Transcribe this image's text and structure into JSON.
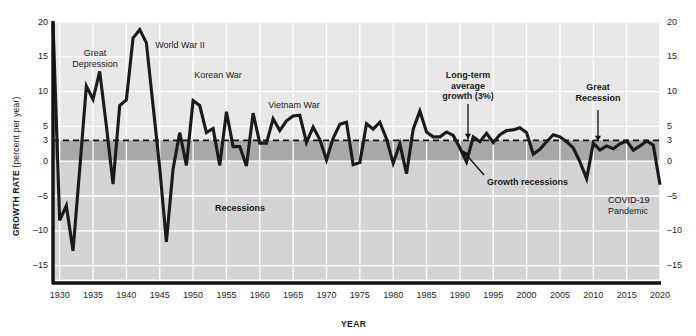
{
  "chart_data": {
    "type": "line",
    "title": "",
    "xlabel": "YEAR",
    "ylabel": "GROWTH RATE",
    "ylabel_unit": "(percent per year)",
    "xlim": [
      1929,
      2020
    ],
    "ylim": [
      -17,
      20
    ],
    "y_ticks": [
      20,
      15,
      10,
      5,
      3,
      0,
      -5,
      -10,
      -15
    ],
    "y_tick_labels": [
      "20",
      "15",
      "10",
      "5",
      "3",
      "0",
      "–5",
      "–10",
      "–15"
    ],
    "x_ticks": [
      1930,
      1935,
      1940,
      1945,
      1950,
      1955,
      1960,
      1965,
      1970,
      1975,
      1980,
      1985,
      1990,
      1995,
      2000,
      2005,
      2010,
      2015,
      2020
    ],
    "x_tick_labels": [
      "1930",
      "1935",
      "1940",
      "1945",
      "1950",
      "1955",
      "1960",
      "1965",
      "1970",
      "1975",
      "1980",
      "1985",
      "1990",
      "1995",
      "2000",
      "2005",
      "2010",
      "2015",
      "2020"
    ],
    "grid": true,
    "legend": "none",
    "reference_line": {
      "value": 3,
      "label": "Long-term average growth (3%)",
      "style": "dashed"
    },
    "bands": [
      {
        "name": "above-average",
        "from": 3,
        "to": 20,
        "color": "#e8e8e8"
      },
      {
        "name": "growth-recession",
        "from": 0,
        "to": 3,
        "color": "#a8a8a8"
      },
      {
        "name": "recession",
        "from": -17,
        "to": 0,
        "color": "#d4d4d4"
      }
    ],
    "series": [
      {
        "name": "US Real GDP Growth Rate",
        "color": "#1a1a1a",
        "x": [
          1929,
          1930,
          1931,
          1932,
          1933,
          1934,
          1935,
          1936,
          1937,
          1938,
          1939,
          1940,
          1941,
          1942,
          1943,
          1944,
          1945,
          1946,
          1947,
          1948,
          1949,
          1950,
          1951,
          1952,
          1953,
          1954,
          1955,
          1956,
          1957,
          1958,
          1959,
          1960,
          1961,
          1962,
          1963,
          1964,
          1965,
          1966,
          1967,
          1968,
          1969,
          1970,
          1971,
          1972,
          1973,
          1974,
          1975,
          1976,
          1977,
          1978,
          1979,
          1980,
          1981,
          1982,
          1983,
          1984,
          1985,
          1986,
          1987,
          1988,
          1989,
          1990,
          1991,
          1992,
          1993,
          1994,
          1995,
          1996,
          1997,
          1998,
          1999,
          2000,
          2001,
          2002,
          2003,
          2004,
          2005,
          2006,
          2007,
          2008,
          2009,
          2010,
          2011,
          2012,
          2013,
          2014,
          2015,
          2016,
          2017,
          2018,
          2019,
          2020
        ],
        "y": [
          20.0,
          -8.5,
          -6.4,
          -12.9,
          -1.2,
          10.8,
          8.9,
          12.9,
          5.1,
          -3.3,
          8.0,
          8.8,
          17.7,
          18.9,
          17.0,
          8.0,
          -1.0,
          -11.6,
          -1.1,
          4.1,
          -0.6,
          8.7,
          8.0,
          4.1,
          4.7,
          -0.6,
          7.1,
          2.1,
          2.1,
          -0.7,
          6.9,
          2.6,
          2.6,
          6.1,
          4.4,
          5.8,
          6.5,
          6.6,
          2.7,
          4.9,
          3.1,
          0.2,
          3.3,
          5.3,
          5.6,
          -0.5,
          -0.2,
          5.4,
          4.6,
          5.6,
          3.2,
          -0.3,
          2.5,
          -1.8,
          4.6,
          7.2,
          4.2,
          3.5,
          3.5,
          4.2,
          3.7,
          1.9,
          -0.1,
          3.5,
          2.8,
          4.0,
          2.7,
          3.8,
          4.4,
          4.5,
          4.8,
          4.1,
          1.0,
          1.7,
          2.8,
          3.8,
          3.5,
          2.8,
          1.9,
          -0.1,
          -2.5,
          2.6,
          1.6,
          2.2,
          1.8,
          2.5,
          2.9,
          1.6,
          2.2,
          2.9,
          2.3,
          -3.4
        ]
      }
    ],
    "annotations": [
      {
        "name": "great-depression",
        "text": "Great\nDepression",
        "bold": false,
        "x": 95,
        "y": 48,
        "align": "center",
        "arrow": false
      },
      {
        "name": "world-war-ii",
        "text": "World War II",
        "bold": false,
        "x": 180,
        "y": 40,
        "align": "center",
        "arrow": false
      },
      {
        "name": "korean-war",
        "text": "Korean War",
        "bold": false,
        "x": 218,
        "y": 70,
        "align": "center",
        "arrow": false
      },
      {
        "name": "vietnam-war",
        "text": "Vietnam War",
        "bold": false,
        "x": 294,
        "y": 100,
        "align": "center",
        "arrow": false
      },
      {
        "name": "long-term-average-growth",
        "text": "Long-term\naverage\ngrowth (3%)",
        "bold": true,
        "x": 468,
        "y": 70,
        "align": "center",
        "arrow": true
      },
      {
        "name": "great-recession",
        "text": "Great\nRecession",
        "bold": true,
        "x": 598,
        "y": 82,
        "align": "center",
        "arrow": true
      },
      {
        "name": "growth-recessions",
        "text": "Growth recessions",
        "bold": true,
        "x": 487,
        "y": 177,
        "align": "left",
        "arrow": true
      },
      {
        "name": "recessions",
        "text": "Recessions",
        "bold": true,
        "x": 240,
        "y": 203,
        "align": "center",
        "arrow": false
      },
      {
        "name": "covid-19-pandemic",
        "text": "COVID-19\nPandemic",
        "bold": false,
        "x": 608,
        "y": 195,
        "align": "left",
        "arrow": false
      }
    ]
  }
}
